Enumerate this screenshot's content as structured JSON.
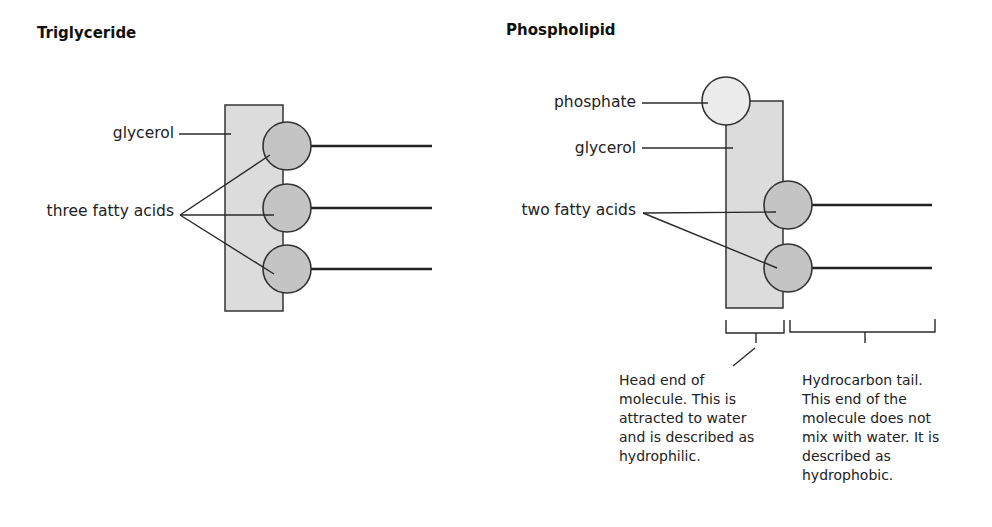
{
  "colors": {
    "glycerol_fill": "#dcdcdc",
    "fatty_acid_fill": "#c4c4c4",
    "phosphate_fill": "#ececec",
    "stroke": "#333333"
  },
  "triglyceride": {
    "title": "Triglyceride",
    "labels": {
      "glycerol": "glycerol",
      "fatty_acids": "three fatty acids"
    }
  },
  "phospholipid": {
    "title": "Phospholipid",
    "labels": {
      "phosphate": "phosphate",
      "glycerol": "glycerol",
      "fatty_acids": "two fatty acids"
    },
    "head_description": {
      "lines": [
        "Head end of",
        "molecule. This is",
        "attracted to water",
        "and is described as",
        "hydrophilic."
      ]
    },
    "tail_description": {
      "lines": [
        "Hydrocarbon tail.",
        "This end of the",
        "molecule does not",
        "mix with water. It is",
        "described as",
        "hydrophobic."
      ]
    }
  }
}
